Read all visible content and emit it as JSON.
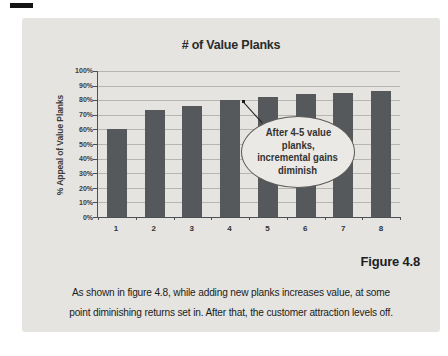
{
  "chart_data": {
    "type": "bar",
    "title": "# of Value Planks",
    "ylabel": "% Appeal of Value Planks",
    "xlabel": "",
    "categories": [
      "1",
      "2",
      "3",
      "4",
      "5",
      "6",
      "7",
      "8"
    ],
    "values": [
      60,
      73,
      76,
      80,
      82,
      84,
      85,
      86
    ],
    "ylim": [
      0,
      100
    ],
    "yticks": [
      "100%",
      "90%",
      "80%",
      "70%",
      "60%",
      "50%",
      "40%",
      "30%",
      "20%",
      "10%",
      "0%"
    ],
    "grid": "horizontal",
    "legend": "none",
    "annotation": {
      "shape": "ellipse-callout",
      "target_bar": "4",
      "text_lines": [
        "After 4-5 value",
        "planks,",
        "incremental gains",
        "diminish"
      ]
    }
  },
  "figure_label": "Figure 4.8",
  "caption": {
    "full_text": "As shown in figure 4.8, while adding new planks increases value, at some point diminishing returns set in. After that, the customer attraction levels off.",
    "lines": [
      "As shown in figure 4.8, while adding new planks increases value, at some",
      "point diminishing returns set in. After that, the customer attraction levels off."
    ]
  },
  "colors": {
    "page_bg": "#ffffff",
    "panel_bg": "#e5e4e0",
    "bar": "#56595c",
    "gridline": "#b6b5b2",
    "axis": "#4e5153",
    "callout_fill": "#eae9e5",
    "callout_border": "#5a5955",
    "text": "#2e2e2e"
  }
}
